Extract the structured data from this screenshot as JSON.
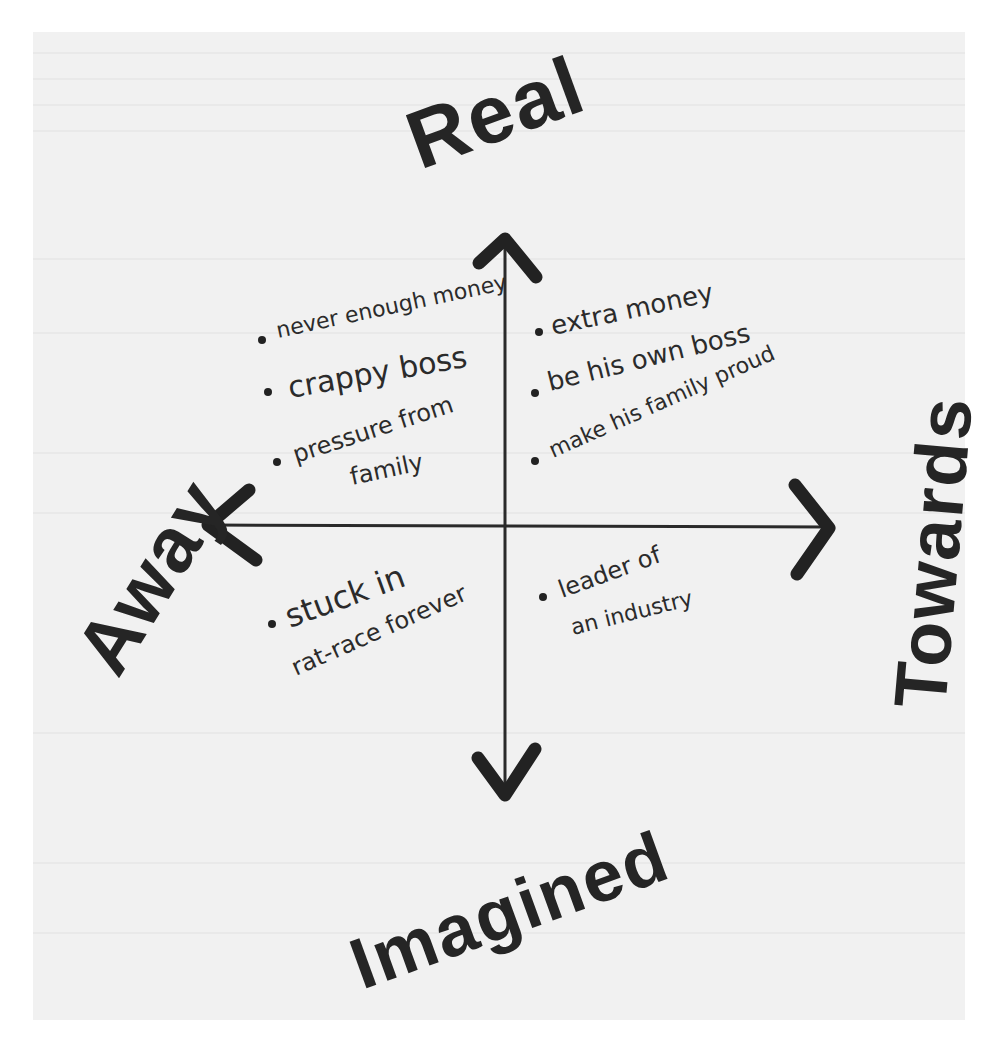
{
  "diagram": {
    "type": "quadrant",
    "axes": {
      "top": "Real",
      "bottom": "Imagined",
      "left": "Away",
      "right": "Towards"
    },
    "quadrants": {
      "top_left": {
        "position": "Real / Away",
        "items": [
          {
            "text": "never enough money"
          },
          {
            "text": "crappy boss"
          },
          {
            "text": "pressure from",
            "text2": "family"
          }
        ]
      },
      "top_right": {
        "position": "Real / Towards",
        "items": [
          {
            "text": "extra money"
          },
          {
            "text": "be his own boss"
          },
          {
            "text": "make his family proud"
          }
        ]
      },
      "bottom_left": {
        "position": "Imagined / Away",
        "items": [
          {
            "text": "stuck in",
            "text2": "rat-race forever"
          }
        ]
      },
      "bottom_right": {
        "position": "Imagined / Towards",
        "items": [
          {
            "text": "leader of",
            "text2": "an industry"
          }
        ]
      }
    },
    "colors": {
      "ink": "#252525",
      "paper": "#f1f1f1",
      "background": "#ffffff"
    }
  }
}
